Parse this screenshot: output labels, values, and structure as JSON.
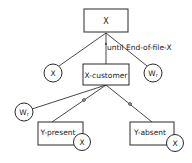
{
  "diagram": {
    "type": "structure-chart",
    "nodes": {
      "root": {
        "label": "X",
        "shape": "rect"
      },
      "left_x": {
        "label": "X",
        "shape": "circle"
      },
      "x_customer": {
        "label": "X-customer",
        "shape": "rect"
      },
      "right_wr": {
        "label": "Wr",
        "shape": "circle"
      },
      "lower_wr": {
        "label": "Wr",
        "shape": "circle"
      },
      "y_present": {
        "label": "Y-present",
        "shape": "rect"
      },
      "y_present_x": {
        "label": "X",
        "shape": "circle"
      },
      "y_absent": {
        "label": "Y-absent",
        "shape": "rect"
      },
      "y_absent_x": {
        "label": "X",
        "shape": "circle"
      }
    },
    "annotations": {
      "iteration": "until End-of-file-X"
    },
    "edges": [
      {
        "from": "root",
        "to": "left_x"
      },
      {
        "from": "root",
        "to": "x_customer",
        "iteration": true
      },
      {
        "from": "root",
        "to": "right_wr"
      },
      {
        "from": "x_customer",
        "to": "lower_wr"
      },
      {
        "from": "x_customer",
        "to": "y_present",
        "selection": true
      },
      {
        "from": "x_customer",
        "to": "y_absent",
        "selection": true
      }
    ]
  }
}
